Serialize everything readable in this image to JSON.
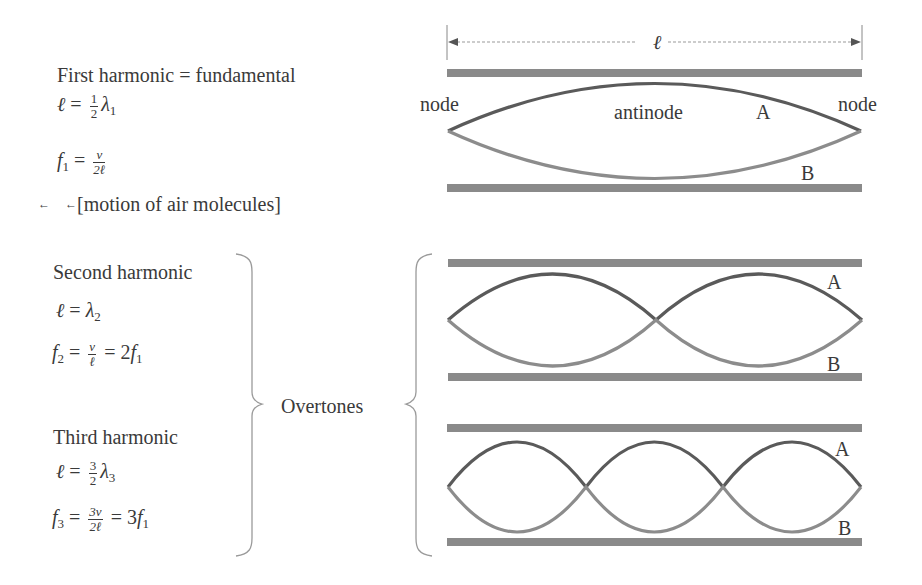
{
  "left_panel": {
    "first": {
      "title": "First harmonic = fundamental",
      "eq1": {
        "lhs": "ℓ",
        "eq": "=",
        "num": "1",
        "den": "2",
        "sym": "λ",
        "sub": "1"
      },
      "eq2": {
        "lhs": "f",
        "lhs_sub": "1",
        "eq": "=",
        "num": "v",
        "den": "2ℓ"
      },
      "motion_label": "[motion of air molecules]",
      "motion_arrow": "←"
    },
    "second": {
      "title": "Second harmonic",
      "eq1": {
        "lhs": "ℓ",
        "eq": "=",
        "sym": "λ",
        "sub": "2"
      },
      "eq2": {
        "lhs": "f",
        "lhs_sub": "2",
        "eq": "=",
        "num": "v",
        "den": "ℓ",
        "eq2": "= 2",
        "rhs": "f",
        "rhs_sub": "1"
      }
    },
    "third": {
      "title": "Third harmonic",
      "eq1": {
        "lhs": "ℓ",
        "eq": "=",
        "num": "3",
        "den": "2",
        "sym": "λ",
        "sub": "3"
      },
      "eq2": {
        "lhs": "f",
        "lhs_sub": "3",
        "eq": "=",
        "num": "3v",
        "den": "2ℓ",
        "eq2": "= 3",
        "rhs": "f",
        "rhs_sub": "1"
      }
    },
    "overtones_label": "Overtones"
  },
  "diagram": {
    "length_label": "ℓ",
    "tube1": {
      "node_left": "node",
      "antinode": "antinode",
      "node_right": "node",
      "curve_a": "A",
      "curve_b": "B",
      "loops": 1
    },
    "tube2": {
      "curve_a": "A",
      "curve_b": "B",
      "loops": 2
    },
    "tube3": {
      "curve_a": "A",
      "curve_b": "B",
      "loops": 3
    },
    "colors": {
      "wall": "#8a8a8a",
      "curve_a": "#5a5a5a",
      "curve_b": "#8c8c8c",
      "text": "#3a3a3a"
    }
  }
}
